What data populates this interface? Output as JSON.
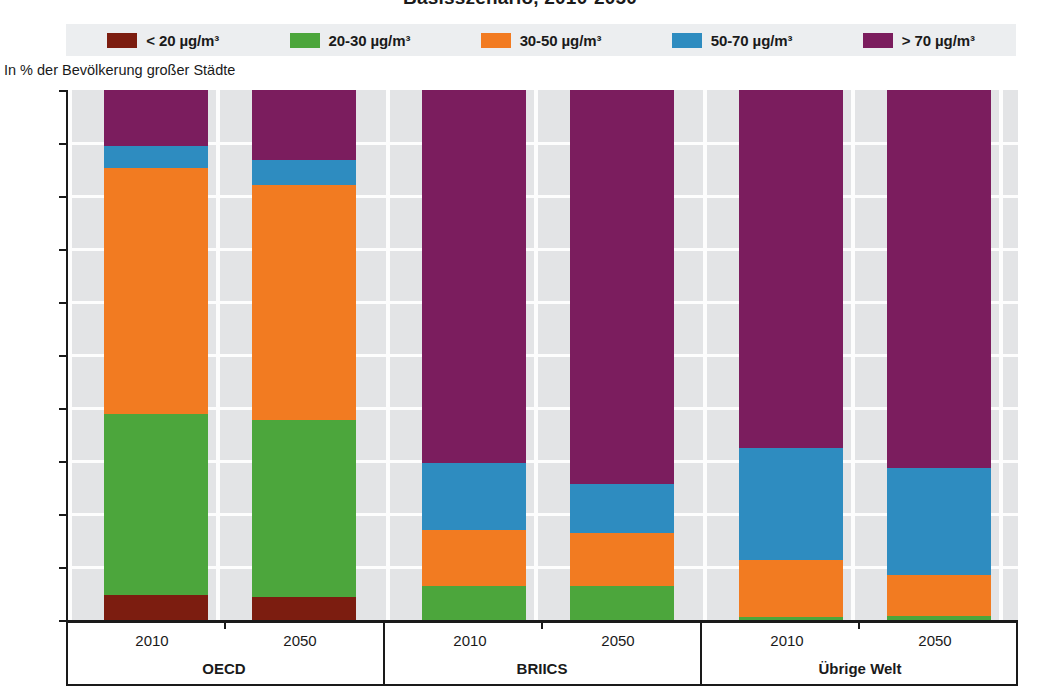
{
  "title": "Basisszenario, 2010-2050",
  "y_axis_title": "In % der Bevölkerung großer Städte",
  "legend": [
    {
      "label": "< 20 µg/m³",
      "color": "#7C1D10"
    },
    {
      "label": "20-30 µg/m³",
      "color": "#4CA63C"
    },
    {
      "label": "30-50 µg/m³",
      "color": "#F27B21"
    },
    {
      "label": "50-70 µg/m³",
      "color": "#2E8CC0"
    },
    {
      "label": "> 70 µg/m³",
      "color": "#7B1D5E"
    }
  ],
  "groups": [
    {
      "label": "OECD",
      "years": [
        "2010",
        "2050"
      ]
    },
    {
      "label": "BRIICS",
      "years": [
        "2010",
        "2050"
      ]
    },
    {
      "label": "Übrige Welt",
      "years": [
        "2010",
        "2050"
      ]
    }
  ],
  "chart_data": {
    "type": "bar",
    "title": "Basisszenario, 2010-2050",
    "subtitle": "",
    "xlabel": "",
    "ylabel": "In % der Bevölkerung großer Städte",
    "ylim": [
      0,
      100
    ],
    "yticks": [
      0,
      10,
      20,
      30,
      40,
      50,
      60,
      70,
      80,
      90,
      100
    ],
    "grid": true,
    "stacked": true,
    "legend_position": "top",
    "categories": [
      "OECD 2010",
      "OECD 2050",
      "BRIICS 2010",
      "BRIICS 2050",
      "Übrige Welt 2010",
      "Übrige Welt 2050"
    ],
    "groups": [
      "OECD",
      "BRIICS",
      "Übrige Welt"
    ],
    "series": [
      {
        "name": "< 20 µg/m³",
        "color": "#7C1D10",
        "values": [
          4.7,
          4.3,
          0.0,
          0.0,
          0.0,
          0.0
        ]
      },
      {
        "name": "20-30 µg/m³",
        "color": "#4CA63C",
        "values": [
          34.2,
          33.4,
          6.4,
          6.4,
          0.5,
          0.8
        ]
      },
      {
        "name": "30-50 µg/m³",
        "color": "#F27B21",
        "values": [
          46.4,
          44.3,
          10.6,
          10.0,
          10.8,
          7.7
        ]
      },
      {
        "name": "50-70 µg/m³",
        "color": "#2E8CC0",
        "values": [
          4.2,
          4.8,
          12.6,
          9.2,
          21.2,
          20.2
        ]
      },
      {
        "name": "> 70 µg/m³",
        "color": "#7B1D5E",
        "values": [
          10.5,
          13.2,
          70.4,
          74.4,
          67.5,
          71.3
        ]
      }
    ]
  },
  "colors": {
    "plot_background": "#E3E4E6",
    "gridline": "#FDFDFD",
    "legend_background": "#ECEEF0",
    "axis": "#1A1A1A"
  }
}
